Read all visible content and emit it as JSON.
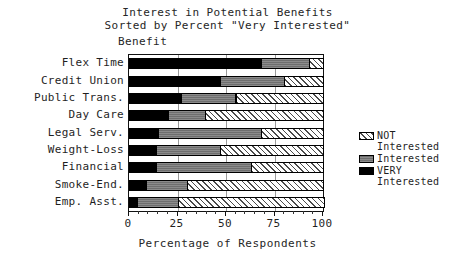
{
  "title": {
    "line1": "Interest in Potential Benefits",
    "line2": "Sorted by Percent \"Very Interested\""
  },
  "axes": {
    "y_caption": "Benefit",
    "x_title": "Percentage of Respondents",
    "x_ticks": [
      "0",
      "25",
      "50",
      "75",
      "100"
    ]
  },
  "legend": {
    "entries": [
      {
        "label": "NOT\nInterested",
        "swatch": "hatched",
        "color": "#ffffff"
      },
      {
        "label": "Interested",
        "swatch": "gray",
        "color": "#6e6e6e"
      },
      {
        "label": "VERY\nInterested",
        "swatch": "black",
        "color": "#000000"
      }
    ]
  },
  "chart_data": {
    "type": "bar",
    "orientation": "horizontal",
    "stacked": true,
    "title": "Interest in Potential Benefits Sorted by Percent \"Very Interested\"",
    "xlabel": "Percentage of Respondents",
    "ylabel": "Benefit",
    "xlim": [
      0,
      100
    ],
    "xticks": [
      0,
      25,
      50,
      75,
      100
    ],
    "grid": true,
    "legend_position": "right",
    "categories": [
      "Flex Time",
      "Credit Union",
      "Public Trans.",
      "Day Care",
      "Legal Serv.",
      "Weight-Loss",
      "Financial",
      "Smoke-End.",
      "Emp. Asst."
    ],
    "series": [
      {
        "name": "VERY Interested",
        "color": "#000000",
        "values": [
          68,
          47,
          27,
          20,
          15,
          14,
          14,
          9,
          4
        ]
      },
      {
        "name": "Interested",
        "color": "#6e6e6e",
        "values": [
          25,
          33,
          28,
          19,
          53,
          33,
          49,
          21,
          21
        ]
      },
      {
        "name": "NOT Interested",
        "color": "#ffffff",
        "values": [
          7,
          20,
          45,
          61,
          32,
          53,
          37,
          70,
          75
        ]
      }
    ]
  }
}
